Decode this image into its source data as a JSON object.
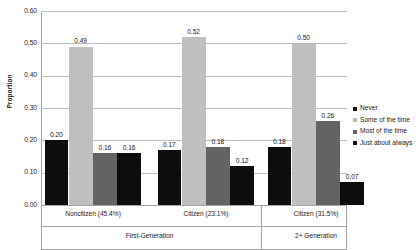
{
  "chart_data": {
    "type": "bar",
    "title": "",
    "subtitle": "",
    "xlabel": "",
    "ylabel": "Proportion",
    "ylim": [
      0.0,
      0.6
    ],
    "ytick_labels": [
      "0.60",
      "0.50",
      "0.40",
      "0.30",
      "0.20",
      "0.10",
      "0.00"
    ],
    "ytick_values": [
      0.6,
      0.5,
      0.4,
      0.3,
      0.2,
      0.1,
      0.0
    ],
    "grid": true,
    "legend_position": "right",
    "categories": [
      "Noncitizen (45.4%)",
      "Citizen (23.1%)",
      "Citizen (31.5%)"
    ],
    "group_headers": [
      {
        "label": "First-Generation",
        "categories": 2
      },
      {
        "label": "2+ Generation",
        "categories": 1
      }
    ],
    "series": [
      {
        "name": "Never",
        "color": "#0d0d0d",
        "values": [
          0.2,
          0.17,
          0.18
        ],
        "labels": [
          "0.20",
          "0.17",
          "0.18"
        ]
      },
      {
        "name": "Some of the time",
        "color": "#bfbfbf",
        "values": [
          0.49,
          0.52,
          0.5
        ],
        "labels": [
          "0.49",
          "0.52",
          "0.50"
        ]
      },
      {
        "name": "Most of the time",
        "color": "#636363",
        "values": [
          0.16,
          0.18,
          0.26
        ],
        "labels": [
          "0.16",
          "0.18",
          "0.26"
        ]
      },
      {
        "name": "Just about always",
        "color": "#0d0d0d",
        "values": [
          0.16,
          0.12,
          0.07
        ],
        "labels": [
          "0.16",
          "0.12",
          "0.07"
        ]
      }
    ]
  }
}
